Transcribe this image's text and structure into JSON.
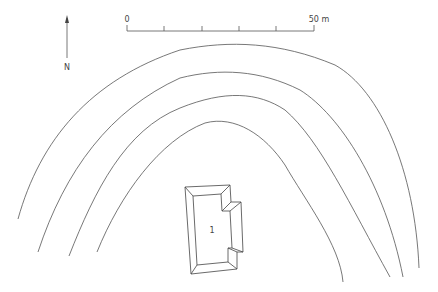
{
  "north_arrow": {
    "label": "N"
  },
  "scale_bar": {
    "start_label": "0",
    "end_label": "50 m",
    "divisions": 5
  },
  "contours": {
    "count": 4
  },
  "features": [
    {
      "label": "1",
      "type": "building"
    }
  ]
}
